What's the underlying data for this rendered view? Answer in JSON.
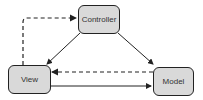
{
  "diagram": {
    "type": "MVC",
    "nodes": {
      "controller": {
        "label": "Controller"
      },
      "view": {
        "label": "View"
      },
      "model": {
        "label": "Model"
      }
    },
    "edges": [
      {
        "from": "view",
        "to": "controller",
        "style": "dashed"
      },
      {
        "from": "controller",
        "to": "view",
        "style": "solid"
      },
      {
        "from": "controller",
        "to": "model",
        "style": "solid"
      },
      {
        "from": "model",
        "to": "view",
        "style": "dashed"
      },
      {
        "from": "view",
        "to": "model",
        "style": "solid"
      }
    ],
    "colors": {
      "node_fill": "#d9d9d9",
      "stroke": "#222222"
    }
  }
}
